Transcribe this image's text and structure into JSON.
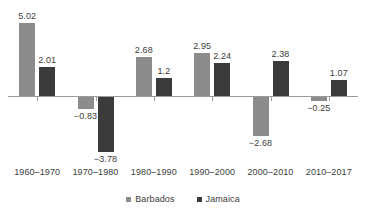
{
  "chart_data": {
    "type": "bar",
    "title": "",
    "subtitle": "",
    "xlabel": "",
    "ylabel": "",
    "grid": false,
    "legend_position": "bottom",
    "ylim": [
      -4.2,
      5.6
    ],
    "zero_line": true,
    "categories": [
      "1960–1970",
      "1970–1980",
      "1980–1990",
      "1990–2000",
      "2000–2010",
      "2010–2017"
    ],
    "series": [
      {
        "name": "Barbados",
        "color": "#8c8c8c",
        "values": [
          5.02,
          -0.83,
          2.68,
          2.95,
          -2.68,
          -0.25
        ],
        "labels": [
          "5.02",
          "−0.83",
          "2.68",
          "2.95",
          "−2.68",
          "−0.25"
        ]
      },
      {
        "name": "Jamaica",
        "color": "#3b3b3b",
        "values": [
          2.01,
          -3.78,
          1.2,
          2.24,
          2.38,
          1.07
        ],
        "labels": [
          "2.01",
          "−3.78",
          "1.2",
          "2.24",
          "2.38",
          "1.07"
        ]
      }
    ]
  },
  "legend": {
    "items": [
      {
        "label": "Barbados",
        "marker": "square-marker",
        "color": "#8c8c8c"
      },
      {
        "label": "Jamaica",
        "marker": "square-marker",
        "color": "#3b3b3b"
      }
    ]
  },
  "axis": {
    "zero_label": "",
    "line_color": "#9a9a9a"
  }
}
